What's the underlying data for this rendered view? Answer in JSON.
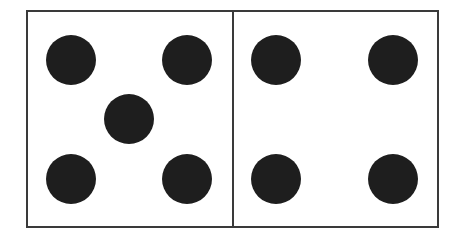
{
  "diagram": {
    "type": "dominoes-tile",
    "colors": {
      "border": "#3a3a3a",
      "pip": "#1e1e1e",
      "background": "#ffffff"
    },
    "frame": {
      "x": 27,
      "y": 11,
      "width": 411,
      "height": 216,
      "divider_x": 233
    },
    "pip_radius": 25,
    "halves": [
      {
        "name": "left-half",
        "pip_count": 5,
        "pips": [
          {
            "cx": 71,
            "cy": 60
          },
          {
            "cx": 187,
            "cy": 60
          },
          {
            "cx": 129,
            "cy": 119
          },
          {
            "cx": 71,
            "cy": 179
          },
          {
            "cx": 187,
            "cy": 179
          }
        ]
      },
      {
        "name": "right-half",
        "pip_count": 4,
        "pips": [
          {
            "cx": 276,
            "cy": 60
          },
          {
            "cx": 393,
            "cy": 60
          },
          {
            "cx": 276,
            "cy": 179
          },
          {
            "cx": 393,
            "cy": 179
          }
        ]
      }
    ]
  }
}
